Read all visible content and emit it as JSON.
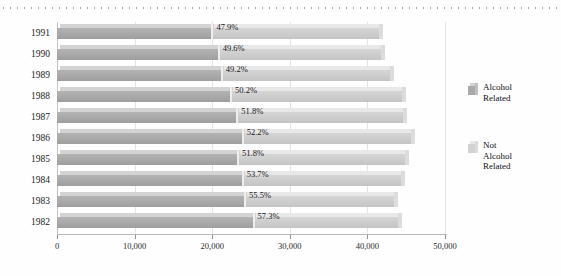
{
  "decor": {
    "top_rule": "dotted-rule"
  },
  "legend": {
    "items": [
      {
        "label_line1": "Alcohol",
        "label_line2": "Related",
        "swatch": "alcohol-related-swatch",
        "color": "#a9a9a9"
      },
      {
        "label_line1": "Not Alcohol",
        "label_line2": "Related",
        "swatch": "not-alcohol-related-swatch",
        "color": "#d2d2d2"
      }
    ]
  },
  "chart_data": {
    "type": "bar",
    "orientation": "horizontal",
    "stacked": true,
    "title": "",
    "xlabel": "",
    "ylabel": "",
    "xlim": [
      0,
      50000
    ],
    "grid": true,
    "legend_position": "right",
    "xticks": [
      0,
      10000,
      20000,
      30000,
      40000,
      50000
    ],
    "xtick_labels": [
      "0",
      "10,000",
      "20,000",
      "30,000",
      "40,000",
      "50,000"
    ],
    "categories": [
      "1991",
      "1990",
      "1989",
      "1988",
      "1987",
      "1986",
      "1985",
      "1984",
      "1983",
      "1982"
    ],
    "series": [
      {
        "name": "Alcohol Related",
        "values": [
          19900,
          20700,
          21100,
          22300,
          23100,
          23800,
          23200,
          23800,
          24100,
          25200
        ]
      },
      {
        "name": "Not Alcohol Related",
        "values": [
          21630,
          21030,
          21780,
          22120,
          21490,
          21790,
          21590,
          20520,
          19320,
          18780
        ]
      }
    ],
    "totals": [
      41530,
      41730,
      42880,
      44420,
      44590,
      45590,
      44790,
      44320,
      43420,
      43980
    ],
    "data_labels": [
      "47.9%",
      "49.6%",
      "49.2%",
      "50.2%",
      "51.8%",
      "52.2%",
      "51.8%",
      "53.7%",
      "55.5%",
      "57.3%"
    ],
    "data_label_note": "percent of total that is alcohol related"
  }
}
